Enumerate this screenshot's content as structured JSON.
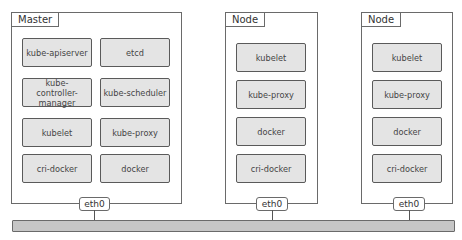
{
  "diagram": {
    "type": "kubernetes-cluster-architecture",
    "hosts": [
      {
        "label": "Master",
        "components": [
          "kube-apiserver",
          "etcd",
          "kube-controller-manager",
          "kube-scheduler",
          "kubelet",
          "kube-proxy",
          "cri-docker",
          "docker"
        ],
        "interface": "eth0"
      },
      {
        "label": "Node",
        "components": [
          "kubelet",
          "kube-proxy",
          "docker",
          "cri-docker"
        ],
        "interface": "eth0"
      },
      {
        "label": "Node",
        "components": [
          "kubelet",
          "kube-proxy",
          "docker",
          "cri-docker"
        ],
        "interface": "eth0"
      }
    ],
    "network_bus": "shared network",
    "colors": {
      "component_fill": "#e4e4e4",
      "component_border": "#5a5a5a",
      "bus_fill": "#c6c6c6",
      "host_border": "#6a6a6a"
    }
  }
}
